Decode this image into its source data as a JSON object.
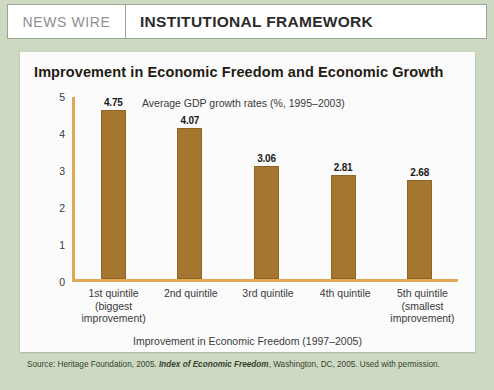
{
  "header": {
    "kicker": "NEWS WIRE",
    "title": "INSTITUTIONAL FRAMEWORK"
  },
  "source": {
    "prefix": "Source: Heritage Foundation, 2005. ",
    "italic": "Index of Economic Freedom",
    "suffix": ", Washington, DC, 2005. Used with permission."
  },
  "colors": {
    "bar_fill": "#a5762f",
    "bar_stroke": "#8e6427",
    "axis": "#e0aa54",
    "frame_green": "#cdd9c2",
    "panel": "#fbfbfb"
  },
  "chart_data": {
    "type": "bar",
    "title": "Improvement in Economic Freedom and Economic Growth",
    "subtitle": "Average GDP growth rates (%, 1995–2003)",
    "categories": [
      "1st quintile\n(biggest\nimprovement)",
      "2nd quintile",
      "3rd quintile",
      "4th quintile",
      "5th quintile\n(smallest\nimprovement)"
    ],
    "category_lines": [
      [
        "1st quintile",
        "(biggest",
        "improvement)"
      ],
      [
        "2nd quintile"
      ],
      [
        "3rd quintile"
      ],
      [
        "4th quintile"
      ],
      [
        "5th quintile",
        "(smallest",
        "improvement)"
      ]
    ],
    "values": [
      4.75,
      4.07,
      3.06,
      2.81,
      2.68
    ],
    "value_labels": [
      "4.75",
      "4.07",
      "3.06",
      "2.81",
      "2.68"
    ],
    "xlabel": "Improvement in Economic Freedom (1997–2005)",
    "ylabel": "",
    "ylim": [
      0,
      5
    ],
    "yticks": [
      5,
      4,
      3,
      2,
      1,
      0
    ],
    "ytick_labels": [
      "5",
      "4",
      "3",
      "2",
      "1",
      "0"
    ],
    "grid": false,
    "legend": "none"
  }
}
